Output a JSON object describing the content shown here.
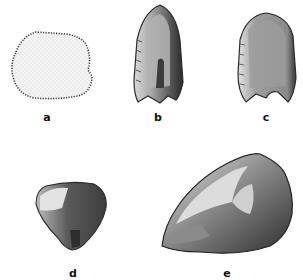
{
  "plate": {
    "type": "archaeological illustration of stone artifacts",
    "background": "#ffffff",
    "ink": "#1a1a1a",
    "figures": [
      {
        "id": "a",
        "label": "a",
        "description": "round scraper, stippled face with retouched edge",
        "label_pos": [
          47,
          112
        ]
      },
      {
        "id": "b",
        "label": "b",
        "description": "point with flaked edges, dark interior",
        "label_pos": [
          158,
          112
        ]
      },
      {
        "id": "c",
        "label": "c",
        "description": "point with notched base, shaded face",
        "label_pos": [
          266,
          112
        ]
      },
      {
        "id": "d",
        "label": "d",
        "description": "small triangular core",
        "label_pos": [
          73,
          268
        ]
      },
      {
        "id": "e",
        "label": "e",
        "description": "large flaked core / chopper",
        "label_pos": [
          227,
          268
        ]
      }
    ]
  }
}
